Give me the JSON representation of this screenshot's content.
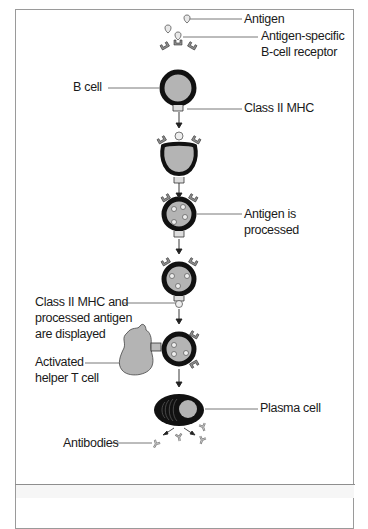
{
  "diagram": {
    "type": "flow",
    "title": "",
    "labels": {
      "antigen": "Antigen",
      "receptor_line1": "Antigen-specific",
      "receptor_line2": "B-cell receptor",
      "b_cell": "B cell",
      "class2_mhc": "Class II MHC",
      "processed_line1": "Antigen is",
      "processed_line2": "processed",
      "displayed_line1": "Class II MHC and",
      "displayed_line2": "processed antigen",
      "displayed_line3": "are displayed",
      "helper_line1": "Activated",
      "helper_line2": "helper T cell",
      "plasma_cell": "Plasma cell",
      "antibodies": "Antibodies"
    },
    "steps": [
      "B cell binds antigen via antigen-specific B-cell receptor",
      "Antigen is internalized",
      "Antigen is processed",
      "Class II MHC and processed antigen are displayed",
      "Activated helper T cell binds",
      "B cell becomes plasma cell secreting antibodies"
    ],
    "colors": {
      "membrane": "#111111",
      "cytoplasm": "#b4b4b4",
      "receptor": "#8f8f8f",
      "leader_line": "#555555",
      "frame_border": "#9a9a9a"
    }
  }
}
